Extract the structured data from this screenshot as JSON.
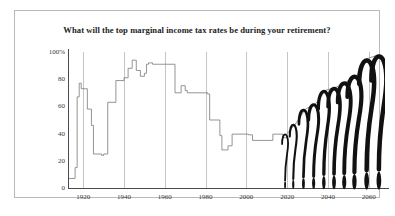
{
  "chart": {
    "title": "What will the top marginal income tax rates be during your retirement?",
    "frame_color": "#b9b9b9",
    "line_color": "#7a7a7a",
    "grid_color": "#c5c5c5",
    "axis_color": "#4a4a4a",
    "qmark_color": "#111111"
  },
  "axes": {
    "y_ticks": [
      "100%",
      "80",
      "60",
      "40",
      "20",
      "0"
    ],
    "x_ticks": [
      "1920",
      "1940",
      "1960",
      "1980",
      "2000",
      "2020",
      "2040",
      "2060"
    ]
  },
  "chart_data": {
    "type": "line",
    "title": "What will the top marginal income tax rates be during your retirement?",
    "xlabel": "",
    "ylabel": "",
    "xlim": [
      1913,
      2068
    ],
    "ylim": [
      0,
      100
    ],
    "grid": "vertical-decades",
    "legend": "none",
    "series": [
      {
        "name": "Historical top marginal income tax rate",
        "x": [
          1913,
          1915,
          1916,
          1917,
          1918,
          1919,
          1921,
          1922,
          1924,
          1925,
          1929,
          1930,
          1932,
          1936,
          1938,
          1940,
          1941,
          1942,
          1944,
          1946,
          1948,
          1950,
          1951,
          1952,
          1954,
          1964,
          1965,
          1968,
          1970,
          1971,
          1981,
          1982,
          1987,
          1988,
          1991,
          1993,
          2001,
          2003,
          2013,
          2018,
          2020
        ],
        "y": [
          7,
          7,
          15,
          67,
          77,
          73,
          73,
          58,
          46,
          25,
          24,
          25,
          63,
          79,
          79,
          81.1,
          81,
          88,
          94,
          86.45,
          82.13,
          84.36,
          91,
          92,
          91,
          91,
          70,
          75.25,
          71.75,
          70,
          69.125,
          50,
          38.5,
          28,
          31,
          39.6,
          39.1,
          35,
          39.6,
          37,
          37
        ]
      },
      {
        "name": "Future projection (uncertain)",
        "x": [
          2020,
          2024,
          2029,
          2034,
          2039,
          2044,
          2049,
          2054,
          2059,
          2065
        ],
        "y": [
          40,
          47,
          58,
          62,
          72,
          74,
          78,
          82,
          95,
          98
        ]
      }
    ],
    "question_marks": [
      {
        "year": 2019,
        "top": 40,
        "height": 40,
        "width": 6
      },
      {
        "year": 2023,
        "top": 47,
        "height": 47,
        "width": 7
      },
      {
        "year": 2028,
        "top": 58,
        "height": 58,
        "width": 9
      },
      {
        "year": 2033,
        "top": 62,
        "height": 62,
        "width": 10
      },
      {
        "year": 2038,
        "top": 72,
        "height": 72,
        "width": 11
      },
      {
        "year": 2043,
        "top": 74,
        "height": 74,
        "width": 12
      },
      {
        "year": 2048,
        "top": 78,
        "height": 78,
        "width": 13
      },
      {
        "year": 2053,
        "top": 83,
        "height": 83,
        "width": 14
      },
      {
        "year": 2059,
        "top": 95,
        "height": 95,
        "width": 15
      },
      {
        "year": 2065,
        "top": 98,
        "height": 98,
        "width": 15
      }
    ],
    "annotation": "Future top marginal rates rendered as question marks indicating uncertainty"
  }
}
